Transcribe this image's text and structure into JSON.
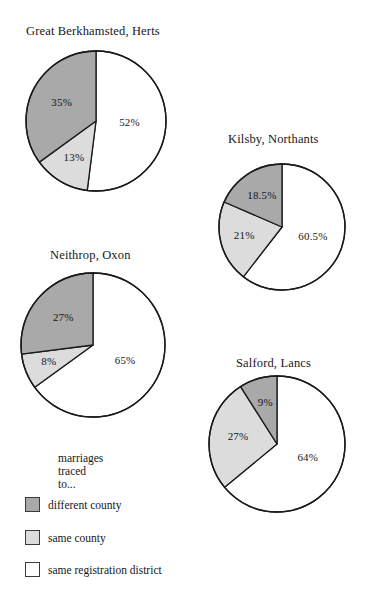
{
  "figure": {
    "caption": "marriages\ntraced to...",
    "background": "#ffffff"
  },
  "legend": {
    "caption_line1": "marriages",
    "caption_line2": "traced to...",
    "items": [
      {
        "label": "different county",
        "color": "#a9a9a9"
      },
      {
        "label": "same county",
        "color": "#dcdcdc"
      },
      {
        "label": "same registration district",
        "color": "#ffffff"
      }
    ]
  },
  "charts": [
    {
      "id": "great-berkhamsted",
      "title": "Great Berkhamsted, Herts",
      "center": {
        "x": 96,
        "y": 121
      },
      "radius": 70,
      "title_x": 26,
      "title_y": 24,
      "slices": [
        {
          "category": "same registration district",
          "value": 52,
          "label": "52%",
          "color": "#ffffff",
          "label_r": 0.48
        },
        {
          "category": "same county",
          "value": 13,
          "label": "13%",
          "color": "#dcdcdc",
          "label_r": 0.62
        },
        {
          "category": "different county",
          "value": 35,
          "label": "35%",
          "color": "#a9a9a9",
          "label_r": 0.55
        }
      ]
    },
    {
      "id": "kilsby",
      "title": "Kilsby, Northants",
      "center": {
        "x": 282,
        "y": 227
      },
      "radius": 63,
      "title_x": 228,
      "title_y": 132,
      "slices": [
        {
          "category": "same registration district",
          "value": 60.5,
          "label": "60.5%",
          "color": "#ffffff",
          "label_r": 0.52
        },
        {
          "category": "same county",
          "value": 21,
          "label": "21%",
          "color": "#dcdcdc",
          "label_r": 0.62
        },
        {
          "category": "different county",
          "value": 18.5,
          "label": "18.5%",
          "color": "#a9a9a9",
          "label_r": 0.58
        }
      ]
    },
    {
      "id": "neithrop",
      "title": "Neithrop, Oxon",
      "center": {
        "x": 93,
        "y": 345
      },
      "radius": 72,
      "title_x": 50,
      "title_y": 248,
      "slices": [
        {
          "category": "same registration district",
          "value": 65,
          "label": "65%",
          "color": "#ffffff",
          "label_r": 0.5
        },
        {
          "category": "same county",
          "value": 8,
          "label": "8%",
          "color": "#dcdcdc",
          "label_r": 0.66
        },
        {
          "category": "different county",
          "value": 27,
          "label": "27%",
          "color": "#a9a9a9",
          "label_r": 0.55
        }
      ]
    },
    {
      "id": "salford",
      "title": "Salford, Lancs",
      "center": {
        "x": 277,
        "y": 444
      },
      "radius": 68,
      "title_x": 236,
      "title_y": 356,
      "slices": [
        {
          "category": "same registration district",
          "value": 64,
          "label": "64%",
          "color": "#ffffff",
          "label_r": 0.5
        },
        {
          "category": "same county",
          "value": 27,
          "label": "27%",
          "color": "#dcdcdc",
          "label_r": 0.58
        },
        {
          "category": "different county",
          "value": 9,
          "label": "9%",
          "color": "#a9a9a9",
          "label_r": 0.62
        }
      ]
    }
  ],
  "chart_data": {
    "type": "pie",
    "title": "",
    "categories": [
      "different county",
      "same county",
      "same registration district"
    ],
    "colors": [
      "#a9a9a9",
      "#dcdcdc",
      "#ffffff"
    ],
    "legend_title": "marriages traced to...",
    "legend_position": "bottom-left",
    "grid": false,
    "panels": [
      {
        "title": "Great Berkhamsted, Herts",
        "values": [
          35,
          13,
          52
        ],
        "labels": [
          "35%",
          "13%",
          "52%"
        ]
      },
      {
        "title": "Kilsby, Northants",
        "values": [
          18.5,
          21,
          60.5
        ],
        "labels": [
          "18.5%",
          "21%",
          "60.5%"
        ]
      },
      {
        "title": "Neithrop, Oxon",
        "values": [
          27,
          8,
          65
        ],
        "labels": [
          "27%",
          "8%",
          "65%"
        ]
      },
      {
        "title": "Salford, Lancs",
        "values": [
          9,
          27,
          64
        ],
        "labels": [
          "9%",
          "27%",
          "64%"
        ]
      }
    ]
  }
}
